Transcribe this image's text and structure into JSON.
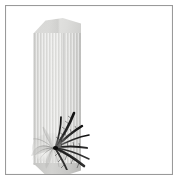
{
  "image": {
    "subject": "tall narrow gift box with floral graphic",
    "canvas_width": 180,
    "canvas_height": 186,
    "background_color": "#ffffff",
    "alt_text": ""
  },
  "frame": {
    "border_color": "#9a9a9a",
    "border_width_px": 1,
    "inner_background": "#ffffff"
  },
  "product": {
    "label": "packaging box",
    "type": "tall rectangular carton",
    "body_color": "#e2e2e0",
    "shadow_color": "#bdbdbb",
    "highlight_color": "#e6e6e4",
    "top_face_color": "#d8d8d6",
    "bottom_face_color": "#c5c5c3",
    "texture": "vertical pinstripes"
  },
  "artwork": {
    "label": "floral leaf graphic",
    "dark_color": "#1a1a1a",
    "mid_color": "#5e5e5e",
    "light_color": "#b4b4b2",
    "description": "dark feathery spiky leaves over a pale open flower"
  }
}
